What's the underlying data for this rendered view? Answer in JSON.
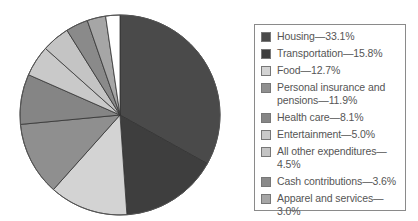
{
  "chart_data": {
    "type": "pie",
    "title": "",
    "start_angle_deg": 0,
    "direction": "clockwise",
    "categories": [
      "Housing",
      "Transportation",
      "Food",
      "Personal insurance and pensions",
      "Health care",
      "Entertainment",
      "All other expenditures",
      "Cash contributions",
      "Apparel and services",
      "Education"
    ],
    "values": [
      33.1,
      15.8,
      12.7,
      11.9,
      8.1,
      5.0,
      4.5,
      3.6,
      3.0,
      2.3
    ],
    "colors": [
      "#4a4a4a",
      "#3e3e3e",
      "#d3d3d3",
      "#8f8f8f",
      "#858585",
      "#c9c9c9",
      "#c4c4c4",
      "#8a8a8a",
      "#a6a6a6",
      "#ffffff"
    ],
    "legend_position": "right",
    "unit": "%"
  },
  "legend": {
    "items": [
      {
        "label": "Housing—33.1%"
      },
      {
        "label": "Transportation—15.8%"
      },
      {
        "label": "Food—12.7%"
      },
      {
        "label": "Personal insurance and pensions—11.9%"
      },
      {
        "label": "Health care—8.1%"
      },
      {
        "label": "Entertainment—5.0%"
      },
      {
        "label": "All other expenditures—4.5%"
      },
      {
        "label": "Cash contributions—3.6%"
      },
      {
        "label": "Apparel and services—3.0%"
      },
      {
        "label": "Education—2.3%"
      }
    ]
  }
}
